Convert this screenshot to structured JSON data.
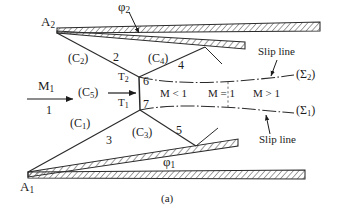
{
  "figure": {
    "caption": "(a)"
  },
  "inlet": {
    "mach_label": "M",
    "mach_sub": "1",
    "region_label": "1"
  },
  "wedges": {
    "upper_apex": "A",
    "upper_apex_sub": "2",
    "lower_apex": "A",
    "lower_apex_sub": "1",
    "upper_angle": "φ",
    "upper_angle_sub": "2",
    "lower_angle": "φ",
    "lower_angle_sub": "1"
  },
  "shocks": [
    {
      "name": "incident-shock-lower",
      "label": "(C",
      "sub": "1",
      "close": ")"
    },
    {
      "name": "incident-shock-upper",
      "label": "(C",
      "sub": "2",
      "close": ")"
    },
    {
      "name": "reflected-shock-lower",
      "label": "(C",
      "sub": "3",
      "close": ")"
    },
    {
      "name": "reflected-shock-upper",
      "label": "(C",
      "sub": "4",
      "close": ")"
    },
    {
      "name": "mach-stem",
      "label": "(C",
      "sub": "5",
      "close": ")"
    }
  ],
  "triple_points": {
    "upper": {
      "label": "T",
      "sub": "2"
    },
    "lower": {
      "label": "T",
      "sub": "1"
    }
  },
  "regions": [
    {
      "id": "1",
      "label": "1"
    },
    {
      "id": "2",
      "label": "2"
    },
    {
      "id": "3",
      "label": "3"
    },
    {
      "id": "4",
      "label": "4"
    },
    {
      "id": "5",
      "label": "5"
    },
    {
      "id": "6",
      "label": "6"
    },
    {
      "id": "7",
      "label": "7"
    }
  ],
  "mach_zones": {
    "subsonic": "M < 1",
    "sonic": "M = 1",
    "supersonic": "M > 1"
  },
  "slip_lines": {
    "upper_name": "(Σ",
    "upper_sub": "2",
    "upper_close": ")",
    "lower_name": "(Σ",
    "lower_sub": "1",
    "lower_close": ")",
    "annotation_upper": "Slip line",
    "annotation_lower": "Slip line"
  },
  "colors": {
    "ink": "#1b1b1b",
    "line": "#2a2a2a",
    "hatch": "#3a3a3a",
    "background": "#ffffff"
  }
}
